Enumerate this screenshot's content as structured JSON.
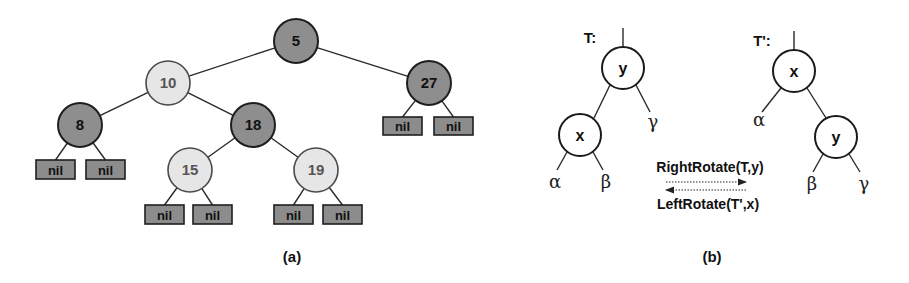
{
  "colors": {
    "black_node_fill": "#8e8e8e",
    "red_node_fill": "#e6e6e6",
    "nil_fill": "#8c8c8c",
    "stroke": "#1e1e1e"
  },
  "panel_a": {
    "caption": "(a)",
    "nodes": [
      {
        "id": "n5",
        "key": "5",
        "color": "black",
        "cx": 296,
        "cy": 41,
        "r": 22
      },
      {
        "id": "n10",
        "key": "10",
        "color": "red",
        "cx": 168,
        "cy": 83,
        "r": 22
      },
      {
        "id": "n27",
        "key": "27",
        "color": "black",
        "cx": 429,
        "cy": 83,
        "r": 22
      },
      {
        "id": "n8",
        "key": "8",
        "color": "black",
        "cx": 80,
        "cy": 125,
        "r": 22
      },
      {
        "id": "n18",
        "key": "18",
        "color": "black",
        "cx": 253,
        "cy": 125,
        "r": 22
      },
      {
        "id": "n15",
        "key": "15",
        "color": "red",
        "cx": 190,
        "cy": 170,
        "r": 22
      },
      {
        "id": "n19",
        "key": "19",
        "color": "red",
        "cx": 316,
        "cy": 170,
        "r": 22
      }
    ],
    "nil_label": "nil",
    "nils": [
      {
        "parent": "n27",
        "x": 383,
        "y": 117,
        "w": 39,
        "h": 18
      },
      {
        "parent": "n27",
        "x": 434,
        "y": 117,
        "w": 39,
        "h": 18
      },
      {
        "parent": "n8",
        "x": 36,
        "y": 160,
        "w": 39,
        "h": 19
      },
      {
        "parent": "n8",
        "x": 86,
        "y": 160,
        "w": 39,
        "h": 19
      },
      {
        "parent": "n15",
        "x": 145,
        "y": 205,
        "w": 39,
        "h": 19
      },
      {
        "parent": "n15",
        "x": 193,
        "y": 205,
        "w": 39,
        "h": 19
      },
      {
        "parent": "n19",
        "x": 274,
        "y": 205,
        "w": 39,
        "h": 19
      },
      {
        "parent": "n19",
        "x": 323,
        "y": 205,
        "w": 39,
        "h": 19
      }
    ],
    "edges": [
      [
        "n5",
        "n10"
      ],
      [
        "n5",
        "n27"
      ],
      [
        "n10",
        "n8"
      ],
      [
        "n10",
        "n18"
      ],
      [
        "n18",
        "n15"
      ],
      [
        "n18",
        "n19"
      ]
    ]
  },
  "panel_b": {
    "caption": "(b)",
    "left_tree": {
      "label": "T:",
      "root": {
        "key": "y",
        "cx": 623,
        "cy": 68,
        "r": 21
      },
      "child": {
        "key": "x",
        "cx": 580,
        "cy": 135,
        "r": 21
      },
      "subtrees": [
        {
          "symbol": "α",
          "x": 555,
          "y": 186
        },
        {
          "symbol": "β",
          "x": 606,
          "y": 186
        },
        {
          "symbol": "γ",
          "x": 653,
          "y": 126
        }
      ]
    },
    "right_tree": {
      "label": "T':",
      "root": {
        "key": "x",
        "cx": 794,
        "cy": 71,
        "r": 21
      },
      "child": {
        "key": "y",
        "cx": 836,
        "cy": 137,
        "r": 21
      },
      "subtrees": [
        {
          "symbol": "α",
          "x": 759,
          "y": 124
        },
        {
          "symbol": "β",
          "x": 812,
          "y": 188
        },
        {
          "symbol": "γ",
          "x": 864,
          "y": 188
        }
      ]
    },
    "operations": {
      "forward": "RightRotate(T,y)",
      "backward": "LeftRotate(T',x)"
    }
  }
}
